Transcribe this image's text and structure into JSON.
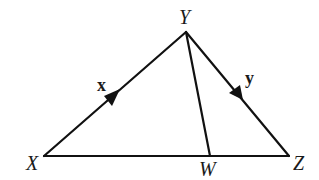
{
  "diagram": {
    "type": "triangle-with-cevian",
    "points": {
      "X": {
        "label": "X",
        "x": 44,
        "y": 156
      },
      "Y": {
        "label": "Y",
        "x": 186,
        "y": 32
      },
      "W": {
        "label": "W",
        "x": 210,
        "y": 156
      },
      "Z": {
        "label": "Z",
        "x": 289,
        "y": 156
      }
    },
    "segments": [
      {
        "from": "X",
        "to": "Y",
        "vector_label": "x"
      },
      {
        "from": "Y",
        "to": "Z",
        "vector_label": "y"
      },
      {
        "from": "X",
        "to": "Z"
      },
      {
        "from": "Y",
        "to": "W"
      }
    ],
    "vectors": {
      "x": {
        "label": "x",
        "direction": "X to Y"
      },
      "y": {
        "label": "y",
        "direction": "Y to Z"
      }
    }
  }
}
